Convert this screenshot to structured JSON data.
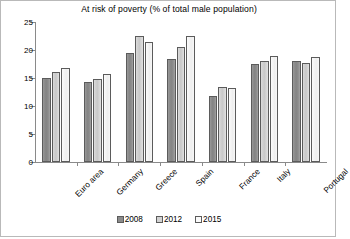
{
  "chart_data": {
    "type": "bar",
    "title": "At risk of poverty (% of total male population)",
    "xlabel": "",
    "ylabel": "",
    "ylim": [
      0,
      25
    ],
    "yticks": [
      0,
      5,
      10,
      15,
      20,
      25
    ],
    "grid": false,
    "legend_position": "bottom",
    "categories": [
      "Euro area",
      "Germany",
      "Greece",
      "Spain",
      "France",
      "Italy",
      "Portugal"
    ],
    "series": [
      {
        "name": "2008",
        "color": "#8b8b8b",
        "values": [
          15.0,
          14.2,
          19.5,
          18.4,
          11.8,
          17.5,
          18.0
        ]
      },
      {
        "name": "2012",
        "color": "#d2d2d2",
        "values": [
          16.0,
          14.9,
          22.5,
          20.6,
          13.4,
          18.1,
          17.7
        ]
      },
      {
        "name": "2015",
        "color": "#fafafa",
        "values": [
          16.7,
          15.8,
          21.5,
          22.5,
          13.2,
          18.9,
          18.8
        ]
      }
    ]
  }
}
